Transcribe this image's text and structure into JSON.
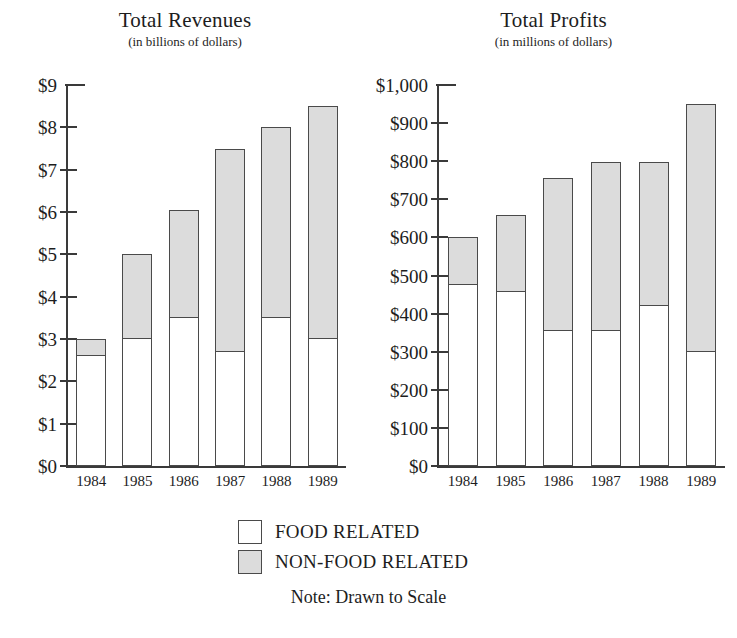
{
  "legend": {
    "items": [
      {
        "label": "FOOD RELATED",
        "color": "#ffffff",
        "key": "food"
      },
      {
        "label": "NON-FOOD RELATED",
        "color": "#dcdcdc",
        "key": "nonfood"
      }
    ],
    "note": "Note: Drawn to Scale"
  },
  "colors": {
    "food": "#ffffff",
    "nonfood": "#dcdcdc",
    "stroke": "#4a4a4a",
    "axis": "#3a3a3a",
    "text": "#1d1d1d",
    "background": "#ffffff"
  },
  "chart_data": [
    {
      "id": "revenues",
      "type": "bar",
      "stacked": true,
      "title": "Total Revenues",
      "subtitle": "(in billions of dollars)",
      "xlabel": "",
      "ylabel": "",
      "ylim": [
        0,
        9
      ],
      "ytick_values": [
        9,
        8,
        7,
        6,
        5,
        4,
        3,
        2,
        1,
        0
      ],
      "ytick_labels": [
        "$9",
        "$8",
        "$7",
        "$6",
        "$5",
        "$4",
        "$3",
        "$2",
        "$1",
        "$0"
      ],
      "grid": false,
      "legend_position": "bottom-center",
      "categories": [
        "1984",
        "1985",
        "1986",
        "1987",
        "1988",
        "1989"
      ],
      "series": [
        {
          "name": "FOOD RELATED",
          "key": "food",
          "color": "#ffffff",
          "values": [
            2.6,
            3.0,
            3.5,
            2.7,
            3.5,
            3.0
          ]
        },
        {
          "name": "NON-FOOD RELATED",
          "key": "nonfood",
          "color": "#dcdcdc",
          "values": [
            0.4,
            2.0,
            2.55,
            4.8,
            4.5,
            5.5
          ]
        }
      ],
      "totals": [
        3.0,
        5.0,
        6.05,
        7.5,
        8.0,
        8.5
      ]
    },
    {
      "id": "profits",
      "type": "bar",
      "stacked": true,
      "title": "Total Profits",
      "subtitle": "(in millions of dollars)",
      "xlabel": "",
      "ylabel": "",
      "ylim": [
        0,
        1000
      ],
      "ytick_values": [
        1000,
        900,
        800,
        700,
        600,
        500,
        400,
        300,
        200,
        100,
        0
      ],
      "ytick_labels": [
        "$1,000",
        "$900",
        "$800",
        "$700",
        "$600",
        "$500",
        "$400",
        "$300",
        "$200",
        "$100",
        "$0"
      ],
      "grid": false,
      "legend_position": "bottom-center",
      "categories": [
        "1984",
        "1985",
        "1986",
        "1987",
        "1988",
        "1989"
      ],
      "series": [
        {
          "name": "FOOD RELATED",
          "key": "food",
          "color": "#ffffff",
          "values": [
            475,
            458,
            355,
            355,
            420,
            300
          ]
        },
        {
          "name": "NON-FOOD RELATED",
          "key": "nonfood",
          "color": "#dcdcdc",
          "values": [
            125,
            202,
            400,
            443,
            378,
            650
          ]
        }
      ],
      "totals": [
        600,
        660,
        755,
        798,
        798,
        950
      ]
    }
  ]
}
